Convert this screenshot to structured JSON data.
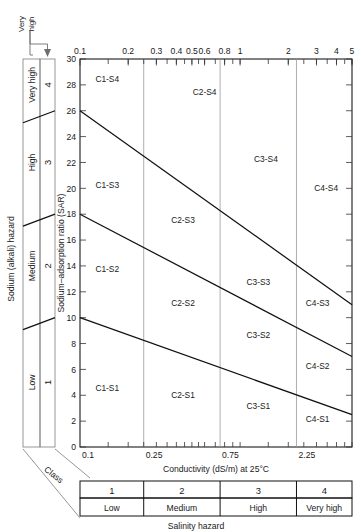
{
  "figure": {
    "top_axis_title": "",
    "bottom_axis_title": "Conductivity (dS/m) at 25°C",
    "y_axis_title": "Sodium–adsorption ratio (SAR)",
    "left_outer_title": "Sodium (alkali) hazard",
    "bottom_outer_title": "Salinity hazard",
    "class_word": "Class",
    "very_high_callout": "Very\nhigh"
  },
  "chart_data": {
    "type": "scatter",
    "title": "",
    "xlabel": "Conductivity (dS/m) at 25°C",
    "ylabel": "Sodium–adsorption ratio (SAR)",
    "xscale": "log",
    "xlim": [
      0.1,
      5
    ],
    "ylim": [
      0,
      30
    ],
    "grid": false,
    "legend": "none",
    "top_tick_labels": [
      "0.1",
      "0.2",
      "0.3",
      "0.4",
      "0.5",
      "0.6",
      "0.8",
      "1",
      "2",
      "3",
      "4",
      "5"
    ],
    "top_tick_values": [
      0.1,
      0.2,
      0.3,
      0.4,
      0.5,
      0.6,
      0.8,
      1,
      2,
      3,
      4,
      5
    ],
    "top_minor_ticks": [
      0.15,
      0.2,
      0.25,
      0.3,
      0.35,
      0.4,
      0.45,
      0.5,
      0.55,
      0.6,
      0.7,
      0.8,
      0.9,
      1,
      1.5,
      2,
      2.5,
      3,
      3.5,
      4,
      4.5,
      5
    ],
    "bottom_tick_labels": [
      "0.1",
      "0.25",
      "0.75",
      "2.25"
    ],
    "bottom_tick_values": [
      0.1,
      0.25,
      0.75,
      2.25
    ],
    "bottom_minor_ticks": [
      0.15,
      0.2,
      0.25,
      0.3,
      0.35,
      0.4,
      0.45,
      0.5,
      0.55,
      0.6,
      0.7,
      0.8,
      0.9,
      1,
      1.5,
      2,
      2.5,
      3,
      3.5,
      4,
      4.5,
      5
    ],
    "y_tick_labels": [
      "0",
      "2",
      "4",
      "6",
      "8",
      "10",
      "12",
      "14",
      "16",
      "18",
      "20",
      "22",
      "24",
      "26",
      "28",
      "30"
    ],
    "y_tick_values": [
      0,
      2,
      4,
      6,
      8,
      10,
      12,
      14,
      16,
      18,
      20,
      22,
      24,
      26,
      28,
      30
    ],
    "salinity_class_boundaries": [
      0.25,
      0.75,
      2.25
    ],
    "sodium_boundary_lines": [
      {
        "name": "S3/S4 boundary",
        "points": [
          [
            0.1,
            26.0
          ],
          [
            5.0,
            11.0
          ]
        ]
      },
      {
        "name": "S2/S3 boundary",
        "points": [
          [
            0.1,
            18.0
          ],
          [
            5.0,
            7.0
          ]
        ]
      },
      {
        "name": "S1/S2 boundary",
        "points": [
          [
            0.1,
            10.0
          ],
          [
            5.0,
            2.5
          ]
        ]
      }
    ],
    "cells": [
      {
        "label": "C1-S4",
        "x": 0.148,
        "y": 28.2
      },
      {
        "label": "C2-S4",
        "x": 0.6,
        "y": 27.2
      },
      {
        "label": "C3-S4",
        "x": 1.45,
        "y": 22.0
      },
      {
        "label": "C4-S4",
        "x": 3.45,
        "y": 19.8
      },
      {
        "label": "C1-S3",
        "x": 0.148,
        "y": 20.0
      },
      {
        "label": "C2-S3",
        "x": 0.44,
        "y": 17.3
      },
      {
        "label": "C3-S3",
        "x": 1.3,
        "y": 12.5
      },
      {
        "label": "C4-S3",
        "x": 3.05,
        "y": 10.9
      },
      {
        "label": "C1-S2",
        "x": 0.148,
        "y": 13.5
      },
      {
        "label": "C2-S2",
        "x": 0.44,
        "y": 10.9
      },
      {
        "label": "C3-S2",
        "x": 1.3,
        "y": 8.4
      },
      {
        "label": "C4-S2",
        "x": 3.05,
        "y": 6.0
      },
      {
        "label": "C1-S1",
        "x": 0.148,
        "y": 4.3
      },
      {
        "label": "C2-S1",
        "x": 0.44,
        "y": 3.8
      },
      {
        "label": "C3-S1",
        "x": 1.3,
        "y": 2.9
      },
      {
        "label": "C4-S1",
        "x": 3.05,
        "y": 1.9
      }
    ]
  },
  "sodium_classes": [
    {
      "number": "1",
      "word": "Low",
      "y_from": 0,
      "y_to": 10
    },
    {
      "number": "2",
      "word": "Medium",
      "y_from": 10,
      "y_to": 18
    },
    {
      "number": "3",
      "word": "High",
      "y_from": 18,
      "y_to": 26
    },
    {
      "number": "4",
      "word": "Very high",
      "y_from": 26,
      "y_to": 30
    }
  ],
  "salinity_classes": [
    {
      "number": "1",
      "word": "Low"
    },
    {
      "number": "2",
      "word": "Medium"
    },
    {
      "number": "3",
      "word": "High"
    },
    {
      "number": "4",
      "word": "Very high"
    }
  ],
  "colors": {
    "ink": "#1a1a1a",
    "frame": "#111111",
    "grid": "#9a9a9a",
    "boundary": "#111111",
    "thin": "#7d7d7d",
    "background": "#ffffff"
  }
}
